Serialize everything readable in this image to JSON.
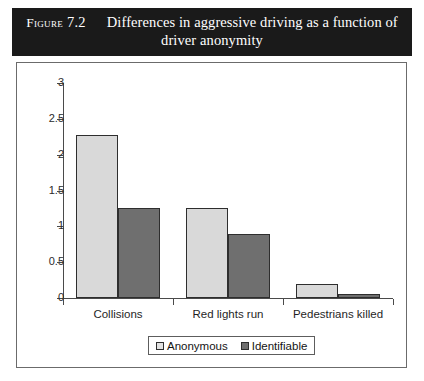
{
  "caption": {
    "label": "Figure",
    "number": "7.2",
    "text": "Differences in aggressive driving as a function of driver anonymity"
  },
  "legend": {
    "items": [
      {
        "label": "Anonymous",
        "swatch_color": "#e2e2e2",
        "icon": "square-swatch-icon"
      },
      {
        "label": "Identifiable",
        "swatch_color": "#6f6f6f",
        "icon": "square-swatch-icon"
      }
    ]
  },
  "chart_data": {
    "type": "bar",
    "title": "Differences in aggressive driving as a function of driver anonymity",
    "categories": [
      "Collisions",
      "Red lights run",
      "Pedestrians killed"
    ],
    "series": [
      {
        "name": "Anonymous",
        "color": "#d9d9d9",
        "values": [
          2.27,
          1.26,
          0.2
        ]
      },
      {
        "name": "Identifiable",
        "color": "#6f6f6f",
        "values": [
          1.25,
          0.89,
          0.05
        ]
      }
    ],
    "xlabel": "",
    "ylabel": "",
    "ylim": [
      0,
      3
    ],
    "yticks": [
      "0",
      "0.5",
      "1",
      "1.5",
      "2",
      "2.5",
      "3"
    ],
    "ytick_values": [
      0,
      0.5,
      1,
      1.5,
      2,
      2.5,
      3
    ],
    "grid": false,
    "legend_position": "bottom"
  }
}
